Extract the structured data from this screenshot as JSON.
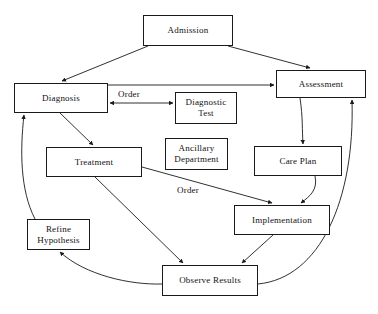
{
  "diagram": {
    "canvas": {
      "width": 378,
      "height": 314
    },
    "stroke_color": "#1a1a1a",
    "text_color": "#111111",
    "background_color": "#ffffff",
    "nodes": [
      {
        "id": "admission",
        "label": "Admission",
        "x": 143,
        "y": 15,
        "w": 90,
        "h": 31
      },
      {
        "id": "diagnosis",
        "label": "Diagnosis",
        "x": 14,
        "y": 83,
        "w": 94,
        "h": 30
      },
      {
        "id": "assessment",
        "label": "Assessment",
        "x": 276,
        "y": 70,
        "w": 90,
        "h": 28
      },
      {
        "id": "diagnostic",
        "label": "Diagnostic\nTest",
        "x": 175,
        "y": 92,
        "w": 62,
        "h": 32
      },
      {
        "id": "treatment",
        "label": "Treatment",
        "x": 46,
        "y": 147,
        "w": 96,
        "h": 30
      },
      {
        "id": "ancillary",
        "label": "Ancillary\nDepartment",
        "x": 165,
        "y": 138,
        "w": 63,
        "h": 32
      },
      {
        "id": "careplan",
        "label": "Care Plan",
        "x": 254,
        "y": 146,
        "w": 88,
        "h": 30
      },
      {
        "id": "implement",
        "label": "Implementation",
        "x": 234,
        "y": 205,
        "w": 96,
        "h": 30
      },
      {
        "id": "refine",
        "label": "Refine\nHypothesis",
        "x": 27,
        "y": 219,
        "w": 63,
        "h": 31
      },
      {
        "id": "observe",
        "label": "Observe Results",
        "x": 162,
        "y": 265,
        "w": 96,
        "h": 31
      }
    ],
    "edge_labels": [
      {
        "id": "order-diagnostic",
        "text": "Order",
        "x": 118,
        "y": 90
      },
      {
        "id": "order-implementation",
        "text": "Order",
        "x": 177,
        "y": 186
      }
    ],
    "edges": [
      {
        "from": "admission",
        "to": "diagnosis",
        "kind": "straight",
        "arrow": "end"
      },
      {
        "from": "admission",
        "to": "assessment",
        "kind": "straight",
        "arrow": "end"
      },
      {
        "from": "diagnosis",
        "to": "assessment",
        "kind": "straight",
        "arrow": "end"
      },
      {
        "from": "diagnosis",
        "to": "diagnostic",
        "kind": "straight",
        "arrow": "both",
        "label": "Order"
      },
      {
        "from": "diagnosis",
        "to": "treatment",
        "kind": "straight",
        "arrow": "end"
      },
      {
        "from": "assessment",
        "to": "careplan",
        "kind": "curve",
        "arrow": "end"
      },
      {
        "from": "careplan",
        "to": "implement",
        "kind": "curve",
        "arrow": "end"
      },
      {
        "from": "treatment",
        "to": "implement",
        "kind": "straight",
        "arrow": "end",
        "label": "Order"
      },
      {
        "from": "treatment",
        "to": "observe",
        "kind": "straight",
        "arrow": "end"
      },
      {
        "from": "implement",
        "to": "observe",
        "kind": "straight",
        "arrow": "end"
      },
      {
        "from": "observe",
        "to": "refine",
        "kind": "curve",
        "arrow": "end"
      },
      {
        "from": "observe",
        "to": "assessment",
        "kind": "curve",
        "arrow": "end"
      },
      {
        "from": "refine",
        "to": "diagnosis",
        "kind": "curve",
        "arrow": "end"
      }
    ]
  }
}
